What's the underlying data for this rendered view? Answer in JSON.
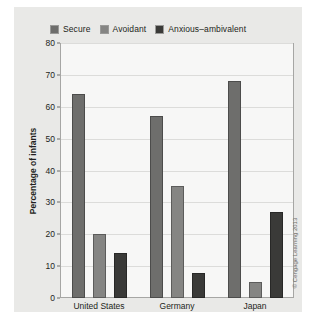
{
  "chart_data": {
    "type": "bar",
    "title": "",
    "xlabel": "",
    "ylabel": "Percentage of infants",
    "categories": [
      "United States",
      "Germany",
      "Japan"
    ],
    "series": [
      {
        "name": "Secure",
        "values": [
          64,
          57,
          68
        ],
        "color": "#6e6e6c"
      },
      {
        "name": "Avoidant",
        "values": [
          20,
          35,
          5
        ],
        "color": "#858583"
      },
      {
        "name": "Anxious–ambivalent",
        "values": [
          14,
          8,
          27
        ],
        "color": "#3a3a38"
      }
    ],
    "ylim": [
      0,
      80
    ],
    "yticks": [
      0,
      10,
      20,
      30,
      40,
      50,
      60,
      70,
      80
    ],
    "grid": true,
    "legend_position": "top"
  },
  "credit": "© Cengage Learning 2013"
}
